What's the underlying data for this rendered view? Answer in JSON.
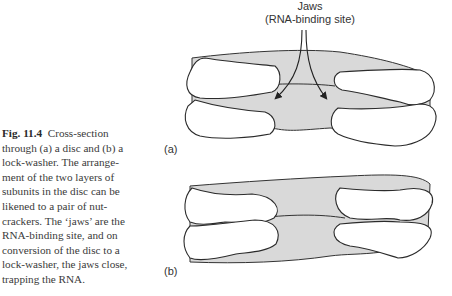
{
  "figure": {
    "label": "Fig. 11.4",
    "caption": "Cross-section through (a) a disc and (b) a lock-washer. The arrangement of the two layers of subunits in the disc can be likened to a pair of nutcrackers. The ‘jaws’ are the RNA-binding site, and on conversion of the disc to a lock-washer, the jaws close, trapping the RNA.",
    "caption_lines": [
      "Cross-section",
      "through (a) a disc and (b) a",
      "lock-washer. The arrange-",
      "ment of the two layers of",
      "subunits in the disc can be",
      "likened to a pair of nut-",
      "crackers. The ‘jaws’ are the",
      "RNA-binding site, and on",
      "conversion of the disc to a",
      "lock-washer, the jaws close,",
      "trapping the RNA."
    ]
  },
  "diagram": {
    "annotation": {
      "line1": "Jaws",
      "line2": "(RNA-binding site)"
    },
    "panels": [
      {
        "label": "(a)",
        "description": "disc"
      },
      {
        "label": "(b)",
        "description": "lock-washer"
      }
    ]
  }
}
